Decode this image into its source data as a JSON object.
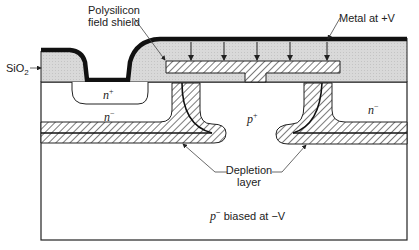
{
  "diagram": {
    "type": "cross-section",
    "labels": {
      "poly_shield_line1": "Polysilicon",
      "poly_shield_line2": "field shield",
      "metal": "Metal at +V",
      "sio2": "SiO",
      "sio2_sub": "2",
      "n_plus": "n",
      "n_plus_sup": "+",
      "n_minus_left": "n",
      "n_minus_left_sup": "−",
      "p_plus": "p",
      "p_plus_sup": "+",
      "n_minus_right": "n",
      "n_minus_right_sup": "−",
      "depletion_line1": "Depletion",
      "depletion_line2": "layer",
      "substrate_p": "p",
      "substrate_sup": "−",
      "substrate_text": " biased at  −V"
    },
    "colors": {
      "oxide_fill": "#d8d8d8",
      "metal": "#111111",
      "hatch": "#333333",
      "outline": "#222222"
    }
  }
}
